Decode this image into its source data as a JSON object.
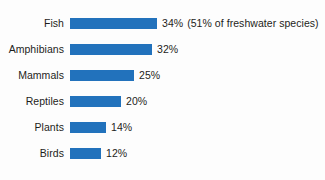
{
  "chart_data": {
    "type": "bar",
    "orientation": "horizontal",
    "title": "",
    "subtitle": "",
    "xlabel": "",
    "ylabel": "",
    "grid": false,
    "legend": false,
    "axis_visible": false,
    "xlim": [
      0,
      34
    ],
    "unit": "%",
    "categories": [
      "Fish",
      "Amphibians",
      "Mammals",
      "Reptiles",
      "Plants",
      "Birds"
    ],
    "values": [
      34,
      32,
      25,
      20,
      14,
      12
    ],
    "value_labels": [
      "34%",
      "32%",
      "25%",
      "20%",
      "14%",
      "12%"
    ],
    "annotations": [
      {
        "category": "Fish",
        "text": "(51% of freshwater species)"
      }
    ],
    "series": [
      {
        "name": "Percent threatened",
        "values": [
          34,
          32,
          25,
          20,
          14,
          12
        ],
        "color": "#2272bc"
      }
    ]
  },
  "rows": [
    {
      "label": "Fish",
      "value": 34,
      "value_label": "34%",
      "note": "(51% of freshwater species)",
      "bar_width_px": 87,
      "top_px": 12
    },
    {
      "label": "Amphibians",
      "value": 32,
      "value_label": "32%",
      "note": "",
      "bar_width_px": 82,
      "top_px": 38
    },
    {
      "label": "Mammals",
      "value": 25,
      "value_label": "25%",
      "note": "",
      "bar_width_px": 64,
      "top_px": 64
    },
    {
      "label": "Reptiles",
      "value": 20,
      "value_label": "20%",
      "note": "",
      "bar_width_px": 51,
      "top_px": 90
    },
    {
      "label": "Plants",
      "value": 14,
      "value_label": "14%",
      "note": "",
      "bar_width_px": 36,
      "top_px": 116
    },
    {
      "label": "Birds",
      "value": 12,
      "value_label": "12%",
      "note": "",
      "bar_width_px": 31,
      "top_px": 142
    }
  ],
  "colors": {
    "bar": "#2272bc",
    "text": "#1d1d1b",
    "background": "#fdfdfd"
  }
}
